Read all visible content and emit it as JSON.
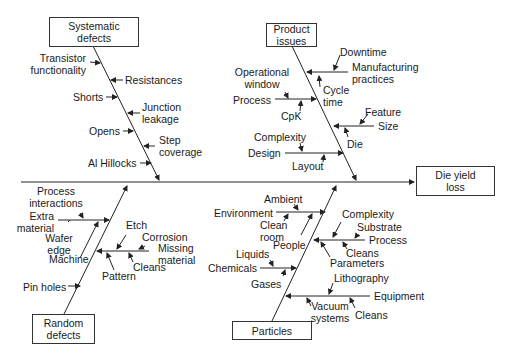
{
  "effect": {
    "label": "Die yield\nloss",
    "line1": "Die yield",
    "line2": "loss"
  },
  "categories": {
    "systematic": {
      "line1": "Systematic",
      "line2": "defects",
      "causes": {
        "transistor": [
          "Transistor",
          "functionality"
        ],
        "resistances": "Resistances",
        "shorts": "Shorts",
        "junction": [
          "Junction",
          "leakage"
        ],
        "opens": "Opens",
        "step": [
          "Step",
          "coverage"
        ],
        "hillocks": "Al Hillocks"
      }
    },
    "product": {
      "line1": "Product",
      "line2": "issues",
      "causes": {
        "downtime": "Downtime",
        "manufacturing": [
          "Manufacturing",
          "practices"
        ],
        "cycle": [
          "Cycle",
          "time"
        ],
        "operational": [
          "Operational",
          "window"
        ],
        "process": "Process",
        "cpk": "CpK",
        "feature": "Feature",
        "size": "Size",
        "die": "Die",
        "complexity": "Complexity",
        "design": "Design",
        "layout": "Layout"
      }
    },
    "random": {
      "line1": "Random",
      "line2": "defects",
      "causes": {
        "process_interactions": [
          "Process",
          "interactions"
        ],
        "extra": [
          "Extra",
          "material"
        ],
        "wafer": [
          "Wafer",
          "edge"
        ],
        "machine": "Machine",
        "etch": "Etch",
        "corrosion": "Corrosion",
        "missing": [
          "Missing",
          "material"
        ],
        "cleans": "Cleans",
        "pattern": "Pattern",
        "pinholes": "Pin holes"
      }
    },
    "particles": {
      "line1": "Particles",
      "causes": {
        "ambient": "Ambient",
        "environment": "Environment",
        "cleanroom": [
          "Clean",
          "room"
        ],
        "people": "People",
        "complexity": "Complexity",
        "substrate": "Substrate",
        "process": "Process",
        "cleans": "Cleans",
        "parameters": "Parameters",
        "liquids": "Liquids",
        "chemicals": "Chemicals",
        "gases": "Gases",
        "lithography": "Lithography",
        "equipment": "Equipment",
        "vacuum": [
          "Vacuum",
          "systems"
        ],
        "cleans2": "Cleans"
      }
    }
  },
  "colors": {
    "line": "#222222",
    "text": "#1a1a1a",
    "background": "#ffffff"
  }
}
